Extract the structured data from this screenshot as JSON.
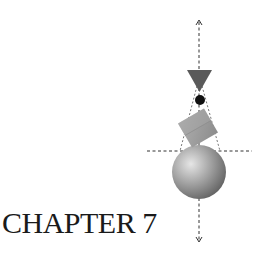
{
  "chapter": {
    "title": "CHAPTER 7"
  },
  "illustration": {
    "description": "Stacked geometric shapes balanced on dashed axes",
    "shapes": [
      "arrow-up-icon",
      "inverted-triangle",
      "small-black-circle",
      "tilted-cube",
      "shaded-sphere",
      "arrow-down-icon"
    ],
    "colors": {
      "triangle": "#5a5a5a",
      "dot": "#111111",
      "cube": "#9a9a9a",
      "sphere_light": "#d8d8d8",
      "sphere_dark": "#6a6a6a",
      "dashes": "#333333"
    }
  }
}
